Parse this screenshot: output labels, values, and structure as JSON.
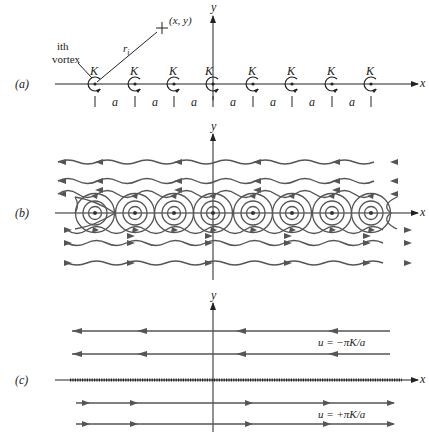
{
  "figure": {
    "panels": [
      {
        "id": "a",
        "label": "(a)",
        "description": "Infinite row of point vortices of equal strength K spaced a apart along the x-axis",
        "axes": {
          "x": "x",
          "y": "y"
        },
        "vortex_label": "K",
        "vortex_count_visible": 8,
        "spacing_label": "a",
        "spacing_count": 7,
        "point_label": "(x, y)",
        "radius_label": "r",
        "radius_subscript": "i",
        "ith_vortex_label_line1": "ith",
        "ith_vortex_label_line2": "vortex"
      },
      {
        "id": "b",
        "label": "(b)",
        "description": "Streamlines of the vortex row: closed cat's-eye circles around each vortex and wavy streamlines above (leftward) and below (rightward)",
        "axes": {
          "x": "x",
          "y": "y"
        },
        "upper_flow_direction": "left",
        "lower_flow_direction": "right"
      },
      {
        "id": "c",
        "label": "(c)",
        "description": "Vortex sheet limit: uniform flow above and below a dense row of vortices",
        "axes": {
          "x": "x",
          "y": "y"
        },
        "upper_velocity_label": "u = −πK/a",
        "lower_velocity_label": "u = +πK/a"
      }
    ],
    "colors": {
      "ink": "#222222",
      "streamline": "#555555",
      "background": "#ffffff"
    }
  }
}
